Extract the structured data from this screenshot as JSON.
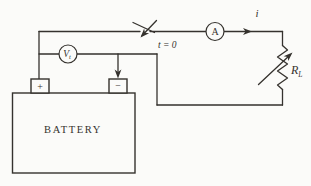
{
  "figure": {
    "background": "#fbfbf9",
    "ink": "#35322e"
  },
  "labels": {
    "switch_time": "t = 0",
    "ammeter": "A",
    "current": "i",
    "resistor": "R",
    "resistor_sub": "L",
    "voltmeter": "V",
    "voltmeter_sub": "t",
    "battery": "BATTERY",
    "positive_terminal": "+",
    "negative_terminal": "−"
  }
}
